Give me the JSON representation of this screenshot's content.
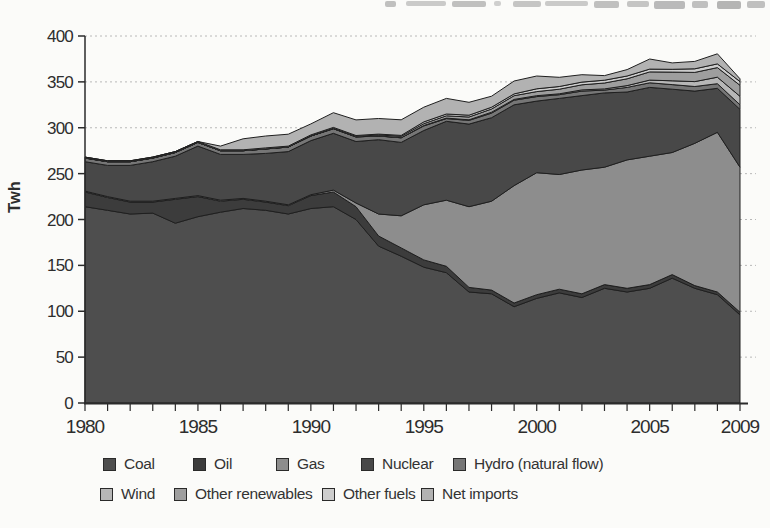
{
  "chart_data": {
    "type": "area",
    "stacked": true,
    "stacking": "bottom-to-top",
    "title": "",
    "xlabel": "",
    "ylabel": "Twh",
    "ylim": [
      0,
      400
    ],
    "y_ticks": [
      0,
      50,
      100,
      150,
      200,
      250,
      300,
      350,
      400
    ],
    "x": [
      1980,
      1981,
      1982,
      1983,
      1984,
      1985,
      1986,
      1987,
      1988,
      1989,
      1990,
      1991,
      1992,
      1993,
      1994,
      1995,
      1996,
      1997,
      1998,
      1999,
      2000,
      2001,
      2002,
      2003,
      2004,
      2005,
      2006,
      2007,
      2008,
      2009
    ],
    "x_tick_labels": [
      "1980",
      "1985",
      "1990",
      "1995",
      "2000",
      "2005",
      "2009"
    ],
    "grid": "horizontal-dashed",
    "legend_position": "bottom",
    "stroke_color": "#1f1f1f",
    "grid_color": "#b8b8b8",
    "axis_color": "#2b2b2b",
    "text_color": "#2d2d2d",
    "series": [
      {
        "name": "Coal",
        "color": "#4e4e4e",
        "values": [
          214,
          210,
          206,
          207,
          196,
          203,
          208,
          212,
          210,
          206,
          212,
          214,
          200,
          171,
          160,
          148,
          142,
          121,
          119,
          105,
          114,
          120,
          115,
          125,
          121,
          125,
          136,
          125,
          118,
          96
        ]
      },
      {
        "name": "Oil",
        "color": "#3c3c3c",
        "values": [
          16,
          14,
          13,
          12,
          26,
          22,
          12,
          10,
          9,
          9,
          14,
          16,
          14,
          11,
          9,
          8,
          7,
          5,
          4,
          4,
          4,
          4,
          4,
          4,
          4,
          4,
          4,
          3,
          3,
          3
        ]
      },
      {
        "name": "Gas",
        "color": "#8d8d8d",
        "values": [
          1,
          1,
          1,
          1,
          1,
          1,
          1,
          1,
          1,
          1,
          1,
          2,
          4,
          24,
          35,
          60,
          72,
          88,
          97,
          128,
          133,
          125,
          135,
          128,
          140,
          140,
          133,
          155,
          174,
          158
        ]
      },
      {
        "name": "Nuclear",
        "color": "#484848",
        "values": [
          32,
          34,
          39,
          43,
          46,
          54,
          50,
          48,
          52,
          58,
          59,
          62,
          67,
          81,
          80,
          81,
          86,
          90,
          91,
          88,
          78,
          83,
          81,
          81,
          74,
          75,
          69,
          57,
          48,
          63
        ]
      },
      {
        "name": "Hydro (natural flow)",
        "color": "#767676",
        "values": [
          4,
          4,
          4,
          4,
          4,
          4,
          4,
          4,
          5,
          5,
          5,
          5,
          5,
          4,
          5,
          5,
          3,
          4,
          5,
          5,
          5,
          4,
          5,
          3,
          5,
          5,
          5,
          5,
          5,
          5
        ]
      },
      {
        "name": "Wind",
        "color": "#b7b7b7",
        "values": [
          0,
          0,
          0,
          0,
          0,
          0,
          0,
          0,
          0,
          0,
          0,
          0,
          0,
          0.1,
          0.2,
          0.4,
          0.5,
          0.7,
          0.9,
          0.9,
          0.9,
          1,
          1.3,
          1.3,
          1.9,
          2.9,
          4.2,
          5.3,
          7.1,
          9.3
        ]
      },
      {
        "name": "Other renewables",
        "color": "#9e9e9e",
        "values": [
          0,
          0,
          0,
          0,
          0,
          0,
          0,
          0,
          0,
          0,
          0.2,
          0.4,
          0.6,
          1,
          1.5,
          2,
          2.5,
          3,
          3.5,
          4,
          4.5,
          5,
          5.5,
          6.5,
          7.5,
          9,
          9.5,
          10,
          10.5,
          12
        ]
      },
      {
        "name": "Other fuels",
        "color": "#cdcdcd",
        "values": [
          1,
          1,
          1,
          1,
          1,
          1,
          1,
          1,
          1,
          1,
          1,
          1,
          1,
          1,
          1,
          2,
          2,
          2,
          2,
          2,
          3,
          3,
          3,
          3,
          3,
          3,
          3,
          4,
          4,
          4
        ]
      },
      {
        "name": "Net imports",
        "color": "#b2b2b2",
        "values": [
          0,
          0,
          0,
          0,
          0,
          0,
          4,
          12,
          13,
          13,
          12,
          16,
          17,
          17,
          17,
          16,
          17,
          14,
          12,
          14,
          14,
          10,
          8,
          5,
          7,
          11,
          7,
          8,
          11,
          3
        ]
      }
    ]
  }
}
